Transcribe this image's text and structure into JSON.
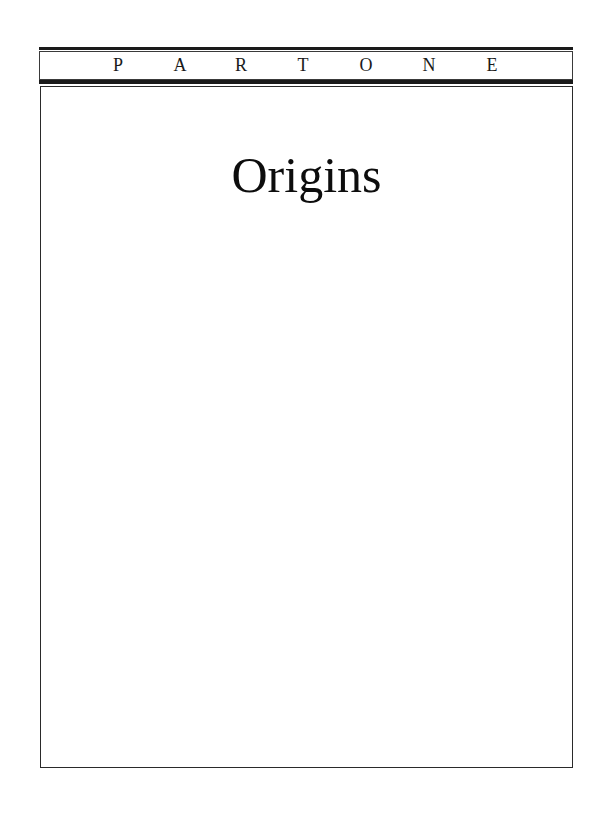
{
  "header": {
    "part_letters": [
      "P",
      "A",
      "R",
      "T",
      "O",
      "N",
      "E"
    ],
    "part_label": "PART ONE"
  },
  "page": {
    "title": "Origins"
  },
  "colors": {
    "rule": "#1a1a1a",
    "border": "#2a2a2a",
    "text": "#0d0d0d",
    "background": "#ffffff"
  }
}
